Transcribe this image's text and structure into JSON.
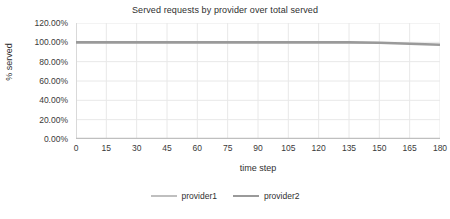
{
  "chart_data": {
    "type": "line",
    "title": "Served requests by provider over total served",
    "xlabel": "time step",
    "ylabel": "% served",
    "grid": true,
    "legend_position": "bottom",
    "xlim": [
      0,
      180
    ],
    "ylim": [
      0,
      120
    ],
    "x_ticks": [
      "0",
      "15",
      "30",
      "45",
      "60",
      "75",
      "90",
      "105",
      "120",
      "135",
      "150",
      "165",
      "180"
    ],
    "x_tick_values": [
      0,
      15,
      30,
      45,
      60,
      75,
      90,
      105,
      120,
      135,
      150,
      165,
      180
    ],
    "y_ticks": [
      "0.00%",
      "20.00%",
      "40.00%",
      "60.00%",
      "80.00%",
      "100.00%",
      "120.00%"
    ],
    "y_tick_values": [
      0,
      20,
      40,
      60,
      80,
      100,
      120
    ],
    "x": [
      0,
      15,
      30,
      45,
      60,
      75,
      90,
      105,
      120,
      135,
      150,
      165,
      180
    ],
    "series": [
      {
        "name": "provider1",
        "color": "#bfbfbf",
        "values": [
          0,
          0,
          0,
          0,
          0,
          0,
          0,
          0,
          0,
          0,
          0,
          0,
          0
        ]
      },
      {
        "name": "provider2",
        "color": "#9a9a9a",
        "values": [
          100,
          100,
          100,
          100,
          100,
          100,
          100,
          100,
          100,
          100,
          99.5,
          98.5,
          97.5
        ]
      }
    ]
  },
  "colors": {
    "background": "#ffffff",
    "grid": "#e8e8e8",
    "axis": "#d9d9d9",
    "text": "#2f2f2f",
    "provider1": "#bfbfbf",
    "provider2": "#9a9a9a"
  }
}
